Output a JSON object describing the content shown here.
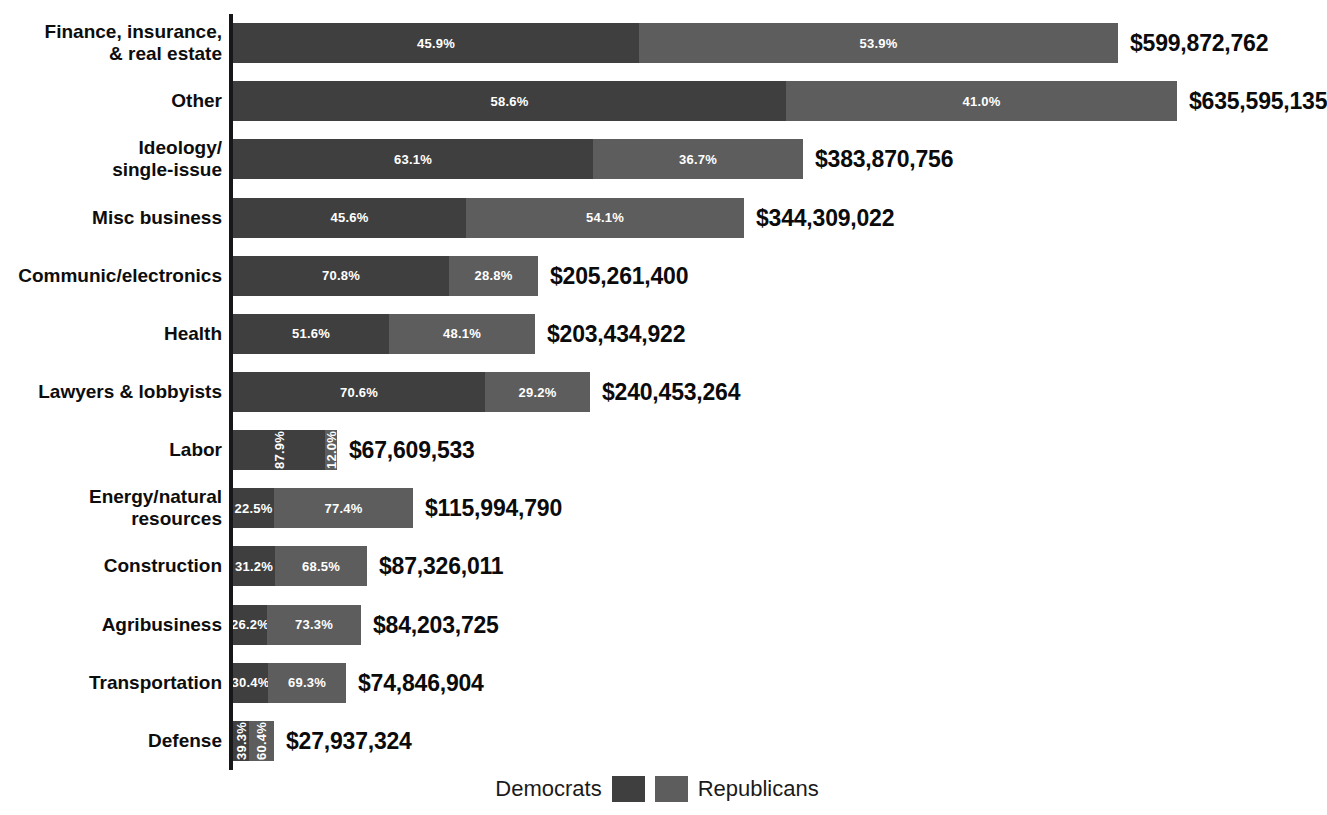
{
  "chart": {
    "title": "",
    "legend": {
      "democrats_label": "Democrats",
      "republicans_label": "Republicans",
      "democrats_color": "#3f3f3f",
      "republicans_color": "#5d5d5d"
    }
  },
  "chart_data": {
    "type": "bar",
    "subtype": "stacked-horizontal-100",
    "title": "",
    "xlabel": "",
    "ylabel": "",
    "grid": false,
    "legend_position": "bottom-center",
    "legend": [
      "Democrats",
      "Republicans"
    ],
    "series": [
      {
        "name": "Democrats",
        "values": [
          45.9,
          58.6,
          63.1,
          45.6,
          70.8,
          51.6,
          70.6,
          87.9,
          22.5,
          31.2,
          26.2,
          30.4,
          39.3
        ]
      },
      {
        "name": "Republicans",
        "values": [
          53.9,
          41.0,
          36.7,
          54.1,
          28.8,
          48.1,
          29.2,
          12.0,
          77.4,
          68.5,
          73.3,
          69.3,
          60.4
        ]
      }
    ],
    "categories": [
      "Finance, insurance, & real estate",
      "Other",
      "Ideology/single-issue",
      "Misc business",
      "Communic/electronics",
      "Health",
      "Lawyers & lobbyists",
      "Labor",
      "Energy/natural resources",
      "Construction",
      "Agribusiness",
      "Transportation",
      "Defense"
    ],
    "totals": [
      599872762,
      635595135,
      383870756,
      344309022,
      205261400,
      203434922,
      240453264,
      67609533,
      115994790,
      87326011,
      84203725,
      74846904,
      27937324
    ],
    "rows": [
      {
        "label_lines": [
          "Finance, insurance,",
          "& real estate"
        ],
        "dem_pct": "45.9%",
        "rep_pct": "53.9%",
        "total": "$599,872,762",
        "bar_width": 885,
        "dem_width": 406,
        "vertical_labels": false
      },
      {
        "label_lines": [
          "Other"
        ],
        "dem_pct": "58.6%",
        "rep_pct": "41.0%",
        "total": "$635,595,135",
        "bar_width": 944,
        "dem_width": 553,
        "vertical_labels": false
      },
      {
        "label_lines": [
          "Ideology/",
          "single-issue"
        ],
        "dem_pct": "63.1%",
        "rep_pct": "36.7%",
        "total": "$383,870,756",
        "bar_width": 570,
        "dem_width": 360,
        "vertical_labels": false
      },
      {
        "label_lines": [
          "Misc business"
        ],
        "dem_pct": "45.6%",
        "rep_pct": "54.1%",
        "total": "$344,309,022",
        "bar_width": 511,
        "dem_width": 233,
        "vertical_labels": false
      },
      {
        "label_lines": [
          "Communic/electronics"
        ],
        "dem_pct": "70.8%",
        "rep_pct": "28.8%",
        "total": "$205,261,400",
        "bar_width": 305,
        "dem_width": 216,
        "vertical_labels": false
      },
      {
        "label_lines": [
          "Health"
        ],
        "dem_pct": "51.6%",
        "rep_pct": "48.1%",
        "total": "$203,434,922",
        "bar_width": 302,
        "dem_width": 156,
        "vertical_labels": false
      },
      {
        "label_lines": [
          "Lawyers & lobbyists"
        ],
        "dem_pct": "70.6%",
        "rep_pct": "29.2%",
        "total": "$240,453,264",
        "bar_width": 357,
        "dem_width": 252,
        "vertical_labels": false
      },
      {
        "label_lines": [
          "Labor"
        ],
        "dem_pct": "87.9%",
        "rep_pct": "12.0%",
        "total": "$67,609,533",
        "bar_width": 104,
        "dem_width": 92,
        "vertical_labels": true
      },
      {
        "label_lines": [
          "Energy/natural",
          "resources"
        ],
        "dem_pct": "22.5%",
        "rep_pct": "77.4%",
        "total": "$115,994,790",
        "bar_width": 180,
        "dem_width": 41,
        "vertical_labels": false
      },
      {
        "label_lines": [
          "Construction"
        ],
        "dem_pct": "31.2%",
        "rep_pct": "68.5%",
        "total": "$87,326,011",
        "bar_width": 134,
        "dem_width": 42,
        "vertical_labels": false
      },
      {
        "label_lines": [
          "Agribusiness"
        ],
        "dem_pct": "26.2%",
        "rep_pct": "73.3%",
        "total": "$84,203,725",
        "bar_width": 128,
        "dem_width": 34,
        "vertical_labels": false
      },
      {
        "label_lines": [
          "Transportation"
        ],
        "dem_pct": "30.4%",
        "rep_pct": "69.3%",
        "total": "$74,846,904",
        "bar_width": 113,
        "dem_width": 35,
        "vertical_labels": false
      },
      {
        "label_lines": [
          "Defense"
        ],
        "dem_pct": "39.3%",
        "rep_pct": "60.4%",
        "total": "$27,937,324",
        "bar_width": 41,
        "dem_width": 16,
        "vertical_labels": true
      }
    ]
  }
}
